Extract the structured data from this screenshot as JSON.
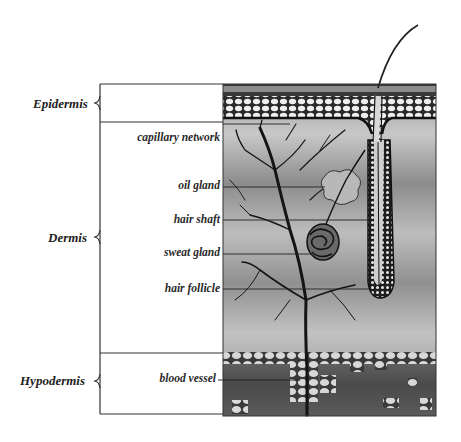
{
  "diagram": {
    "layers": [
      {
        "id": "epidermis",
        "label": "Epidermis"
      },
      {
        "id": "dermis",
        "label": "Dermis"
      },
      {
        "id": "hypodermis",
        "label": "Hypodermis"
      }
    ],
    "parts": [
      {
        "id": "capillary-network",
        "label": "capillary network"
      },
      {
        "id": "oil-gland",
        "label": "oil gland"
      },
      {
        "id": "hair-shaft",
        "label": "hair shaft"
      },
      {
        "id": "sweat-gland",
        "label": "sweat gland"
      },
      {
        "id": "hair-follicle",
        "label": "hair follicle"
      },
      {
        "id": "blood-vessel",
        "label": "blood vessel"
      }
    ],
    "colors": {
      "line": "#333333",
      "dermis_bg": "#8a8a8a",
      "cells": "#eeeeee",
      "vessel": "#1a1a1a"
    }
  }
}
